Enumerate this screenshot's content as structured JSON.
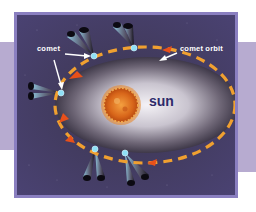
{
  "diagram": {
    "labels": {
      "comet": "comet",
      "comet_orbit": "comet orbit",
      "sun": "sun"
    },
    "colors": {
      "panel_border": "#8a7fc0",
      "background_bands": "#b7abd0",
      "space": "#3a3448",
      "orbit_dash": "#f0a030",
      "comet_head": "#7fd8f0",
      "sun": "#e07a20",
      "sun_label": "#2d2a6a",
      "arrow": "#ffffff"
    },
    "elements": [
      {
        "name": "sun",
        "type": "star"
      },
      {
        "name": "comet-orbit",
        "type": "elliptical-dashed-path"
      },
      {
        "name": "comets",
        "count": 8,
        "description": "comet positions along orbit with tails pointing away from sun"
      }
    ]
  }
}
